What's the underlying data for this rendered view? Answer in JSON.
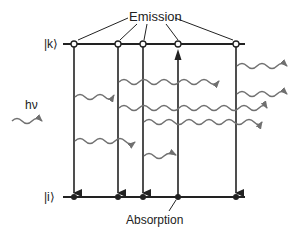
{
  "diagram": {
    "labels": {
      "emission": "Emission",
      "absorption": "Absorption",
      "upper_level": "|k⟩",
      "lower_level": "|i⟩",
      "photon": "hν"
    },
    "colors": {
      "line": "#222222",
      "wave": "#707070",
      "background": "#ffffff"
    },
    "levels": [
      {
        "name": "upper",
        "label": "|k⟩",
        "y": 44
      },
      {
        "name": "lower",
        "label": "|i⟩",
        "y": 197
      }
    ],
    "transitions": [
      {
        "x": 74,
        "type": "emission"
      },
      {
        "x": 118,
        "type": "emission"
      },
      {
        "x": 143,
        "type": "emission"
      },
      {
        "x": 178,
        "type": "absorption"
      },
      {
        "x": 236,
        "type": "emission"
      }
    ]
  }
}
